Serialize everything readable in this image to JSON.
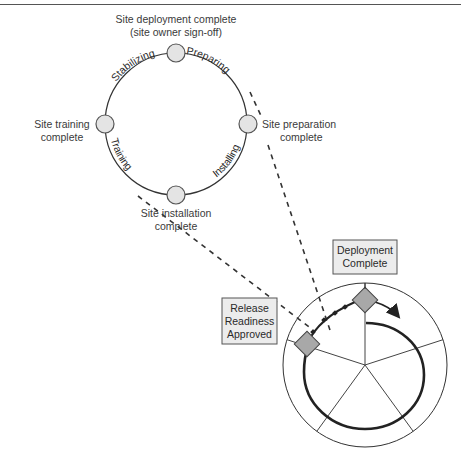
{
  "colors": {
    "line": "#333333",
    "node_fill": "#e4e4e4",
    "node_stroke": "#555555",
    "diamond_fill": "#a8a8a8",
    "box_fill": "#ececec",
    "box_stroke": "#555555",
    "text": "#3a3a3a"
  },
  "cycle": {
    "nodes": [
      {
        "id": "top",
        "label_lines": [
          "Site deployment complete",
          "(site owner sign-off)"
        ]
      },
      {
        "id": "right",
        "label_lines": [
          "Site preparation",
          "complete"
        ]
      },
      {
        "id": "bottom",
        "label_lines": [
          "Site installation",
          "complete"
        ]
      },
      {
        "id": "left",
        "label_lines": [
          "Site training",
          "complete"
        ]
      }
    ],
    "phases": [
      {
        "id": "preparing",
        "label": "Preparing"
      },
      {
        "id": "installing",
        "label": "Installing"
      },
      {
        "id": "training",
        "label": "Training"
      },
      {
        "id": "stabilizing",
        "label": "Stabilizing"
      }
    ]
  },
  "milestones": {
    "deployment_complete": {
      "label_lines": [
        "Deployment",
        "Complete"
      ]
    },
    "release_readiness": {
      "label_lines": [
        "Release",
        "Readiness",
        "Approved"
      ]
    }
  },
  "process_wheel": {
    "sectors": 5
  }
}
